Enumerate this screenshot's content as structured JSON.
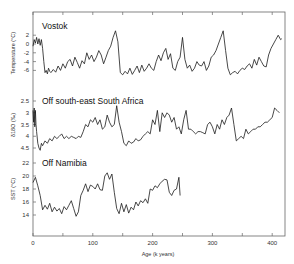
{
  "chart_data": {
    "type": "line",
    "title": "",
    "xlabel": "Age (k years)",
    "xlim": [
      0,
      420
    ],
    "x_ticks": [
      0,
      100,
      200,
      300,
      400
    ],
    "x_minor_ticks": [
      50,
      150,
      250,
      350
    ],
    "grid": false,
    "legend": null,
    "panels": [
      {
        "name": "Vostok",
        "ylabel": "Temperature (°C)",
        "y_ticks": [
          "2",
          "0",
          "-2",
          "-4",
          "-6"
        ],
        "y_tick_values": [
          2,
          0,
          -2,
          -4,
          -6
        ],
        "ylim": [
          -7.5,
          3.5
        ],
        "series": [
          {
            "name": "Vostok temperature",
            "x": [
              0,
              2,
              4,
              6,
              8,
              10,
              12,
              14,
              16,
              18,
              20,
              22,
              24,
              26,
              28,
              30,
              34,
              38,
              42,
              46,
              50,
              54,
              58,
              62,
              66,
              70,
              74,
              78,
              82,
              86,
              90,
              94,
              98,
              102,
              106,
              110,
              114,
              118,
              122,
              126,
              130,
              134,
              138,
              142,
              146,
              150,
              154,
              158,
              162,
              166,
              170,
              174,
              178,
              182,
              186,
              190,
              194,
              198,
              202,
              206,
              210,
              214,
              218,
              222,
              226,
              230,
              234,
              238,
              242,
              246,
              250,
              254,
              258,
              262,
              266,
              270,
              274,
              278,
              282,
              286,
              290,
              294,
              298,
              302,
              306,
              310,
              314,
              318,
              322,
              326,
              330,
              334,
              338,
              342,
              346,
              350,
              354,
              358,
              362,
              366,
              370,
              374,
              378,
              382,
              386,
              390,
              394,
              398,
              402,
              406,
              410,
              414,
              416
            ],
            "values": [
              -0.5,
              1.0,
              0.2,
              1.5,
              0.0,
              1.2,
              -0.3,
              1.0,
              -1.0,
              -4.0,
              -6.5,
              -6.0,
              -6.8,
              -5.5,
              -6.2,
              -6.5,
              -5.8,
              -6.4,
              -5.0,
              -6.0,
              -4.5,
              -5.5,
              -4.0,
              -3.5,
              -5.0,
              -3.0,
              -4.2,
              -5.5,
              -3.8,
              -4.5,
              -2.0,
              -3.5,
              -2.5,
              -4.0,
              -3.0,
              -1.5,
              -2.5,
              -4.5,
              -3.0,
              -1.5,
              -0.5,
              1.5,
              3.0,
              0.5,
              -6.5,
              -7.0,
              -6.2,
              -6.8,
              -5.5,
              -6.9,
              -6.0,
              -5.0,
              -6.5,
              -4.8,
              -6.2,
              -5.5,
              -4.5,
              -5.5,
              -6.0,
              -4.0,
              -2.5,
              -3.8,
              -2.0,
              -1.0,
              -3.5,
              -2.2,
              -5.5,
              -6.0,
              -4.0,
              -3.0,
              1.5,
              -3.5,
              -5.5,
              -4.8,
              -6.2,
              -5.5,
              -4.0,
              -4.8,
              -5.0,
              -4.0,
              -6.0,
              -5.0,
              -3.0,
              -2.5,
              -1.5,
              0.0,
              1.5,
              3.0,
              -1.5,
              -5.5,
              -7.0,
              -6.5,
              -6.2,
              -6.8,
              -6.0,
              -5.5,
              -5.8,
              -5.0,
              -4.5,
              -5.5,
              -3.5,
              -4.8,
              -3.0,
              -4.0,
              -5.0,
              -5.2,
              -2.5,
              -1.0,
              0.0,
              1.0,
              2.0,
              1.0,
              1.2
            ]
          }
        ]
      },
      {
        "name": "Off south-east South Africa",
        "ylabel": "δ18O (‰)",
        "y_ticks": [
          "2.5",
          "3",
          "3.5",
          "4",
          "4.5"
        ],
        "y_tick_values": [
          2.5,
          3,
          3.5,
          4,
          4.5
        ],
        "ylim": [
          4.5,
          2.3
        ],
        "y_inverted": true,
        "series": [
          {
            "name": "SE South Africa δ18O",
            "x": [
              0,
              1,
              2,
              3,
              4,
              5,
              6,
              8,
              10,
              12,
              14,
              16,
              20,
              24,
              28,
              32,
              36,
              40,
              44,
              48,
              52,
              56,
              60,
              64,
              68,
              72,
              76,
              80,
              84,
              88,
              92,
              96,
              100,
              104,
              108,
              112,
              116,
              120,
              124,
              128,
              132,
              136,
              140,
              144,
              148,
              152,
              156,
              160,
              164,
              168,
              172,
              176,
              180,
              184,
              188,
              192,
              196,
              200,
              204,
              208,
              212,
              216,
              220,
              224,
              228,
              232,
              236,
              240,
              244,
              248,
              252,
              256,
              260,
              264,
              268,
              272,
              276,
              280,
              284,
              288,
              292,
              296,
              300,
              304,
              308,
              312,
              316,
              320,
              324,
              328,
              332,
              336,
              340,
              344,
              348,
              352,
              356,
              360,
              364,
              368,
              372,
              376,
              380,
              384,
              388,
              392,
              396,
              400,
              404,
              408,
              412
            ],
            "values": [
              2.9,
              3.4,
              2.8,
              3.6,
              2.9,
              3.5,
              3.8,
              4.3,
              4.5,
              4.6,
              4.3,
              4.4,
              4.2,
              4.3,
              4.1,
              4.2,
              4.0,
              4.1,
              4.0,
              3.9,
              4.1,
              4.0,
              4.1,
              4.0,
              4.05,
              4.1,
              4.0,
              4.05,
              3.8,
              3.5,
              3.6,
              3.3,
              3.4,
              3.2,
              3.5,
              3.3,
              3.7,
              3.6,
              3.1,
              3.4,
              3.6,
              3.5,
              2.7,
              3.4,
              3.8,
              4.3,
              4.4,
              4.2,
              4.3,
              4.25,
              4.1,
              4.2,
              4.15,
              4.0,
              3.9,
              3.8,
              3.9,
              3.3,
              3.5,
              2.9,
              3.8,
              3.0,
              3.2,
              3.0,
              3.1,
              3.4,
              3.2,
              3.7,
              3.6,
              3.9,
              3.3,
              2.9,
              3.7,
              3.7,
              3.8,
              3.9,
              3.8,
              3.8,
              3.85,
              3.9,
              3.5,
              3.4,
              3.6,
              3.9,
              3.5,
              3.7,
              3.3,
              3.5,
              3.2,
              3.1,
              2.8,
              3.5,
              4.2,
              4.1,
              4.0,
              4.1,
              3.7,
              3.9,
              3.8,
              3.7,
              3.7,
              3.6,
              3.6,
              3.5,
              3.4,
              3.4,
              3.3,
              3.2,
              2.8,
              2.9,
              3.0
            ]
          }
        ]
      },
      {
        "name": "Off Namibia",
        "ylabel": "SST (°C)",
        "y_ticks": [
          "22",
          "20",
          "18",
          "16",
          "14"
        ],
        "y_tick_values": [
          22,
          20,
          18,
          16,
          14
        ],
        "ylim": [
          11,
          22.5
        ],
        "series": [
          {
            "name": "Namibia SST",
            "x": [
              0,
              4,
              8,
              12,
              16,
              20,
              24,
              28,
              32,
              36,
              40,
              44,
              48,
              52,
              56,
              60,
              64,
              68,
              72,
              76,
              80,
              84,
              88,
              92,
              96,
              100,
              104,
              108,
              112,
              116,
              120,
              124,
              128,
              132,
              136,
              140,
              144,
              148,
              152,
              156,
              160,
              164,
              168,
              172,
              176,
              180,
              184,
              188,
              192,
              196,
              200,
              204,
              208,
              212,
              216,
              220,
              224,
              228,
              232,
              236,
              240,
              244,
              246
            ],
            "values": [
              19.0,
              19.8,
              18.5,
              17.0,
              14.8,
              15.5,
              14.9,
              15.8,
              14.5,
              15.2,
              14.6,
              15.0,
              14.2,
              15.3,
              14.8,
              15.5,
              16.2,
              15.0,
              13.8,
              14.5,
              17.0,
              17.8,
              18.8,
              17.6,
              18.6,
              18.4,
              18.0,
              18.8,
              17.9,
              17.8,
              20.0,
              20.5,
              19.5,
              20.3,
              17.5,
              15.0,
              14.2,
              15.8,
              14.5,
              15.6,
              14.3,
              15.2,
              14.8,
              16.0,
              15.4,
              16.2,
              15.9,
              16.5,
              15.8,
              18.0,
              17.8,
              18.5,
              18.2,
              18.8,
              19.2,
              19.5,
              19.4,
              17.5,
              17.0,
              17.8,
              18.0,
              19.8,
              17.0
            ]
          }
        ]
      }
    ]
  },
  "labels": {
    "panel_vostok": "Vostok",
    "panel_se_africa": "Off south-east South Africa",
    "panel_namibia": "Off Namibia",
    "ylabel_vostok": "Temperature (°C)",
    "ylabel_se_africa": "δ18O (‰)",
    "ylabel_namibia": "SST (°C)",
    "xlabel": "Age (k years)"
  },
  "colors": {
    "line": "#1a1a1a",
    "frame": "#555555",
    "background": "#ffffff"
  }
}
